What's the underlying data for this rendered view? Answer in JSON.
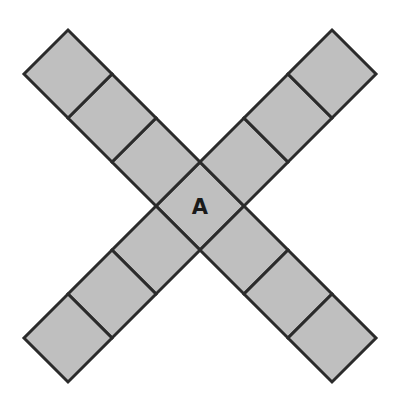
{
  "figure": {
    "name": "x-shaped-tiling-of-squares",
    "type": "geometry-diagram",
    "background_color": "#ffffff",
    "tile_fill_color": "#bfbfbf",
    "tile_stroke_color": "#2b2b2b",
    "tile_stroke_width": 3,
    "label_color": "#1a1a1a",
    "canvas": {
      "width": 400,
      "height": 411
    },
    "geometry": {
      "center_x": 200,
      "center_y": 206,
      "half_diagonal": 44,
      "square_count": 13,
      "arm_count": 4,
      "squares_per_arm": 3,
      "rotation_degrees": 45
    },
    "tiles": [
      {
        "id": "center",
        "label": "A",
        "cx": 200,
        "cy": 206
      },
      {
        "id": "ul-1",
        "label": "",
        "cx": 156,
        "cy": 162
      },
      {
        "id": "ul-2",
        "label": "",
        "cx": 112,
        "cy": 118
      },
      {
        "id": "ul-3",
        "label": "",
        "cx": 68,
        "cy": 74
      },
      {
        "id": "ur-1",
        "label": "",
        "cx": 244,
        "cy": 162
      },
      {
        "id": "ur-2",
        "label": "",
        "cx": 288,
        "cy": 118
      },
      {
        "id": "ur-3",
        "label": "",
        "cx": 332,
        "cy": 74
      },
      {
        "id": "ll-1",
        "label": "",
        "cx": 156,
        "cy": 250
      },
      {
        "id": "ll-2",
        "label": "",
        "cx": 112,
        "cy": 294
      },
      {
        "id": "ll-3",
        "label": "",
        "cx": 68,
        "cy": 338
      },
      {
        "id": "lr-1",
        "label": "",
        "cx": 244,
        "cy": 250
      },
      {
        "id": "lr-2",
        "label": "",
        "cx": 288,
        "cy": 294
      },
      {
        "id": "lr-3",
        "label": "",
        "cx": 332,
        "cy": 338
      }
    ],
    "labels": {
      "center_label": "A"
    }
  }
}
